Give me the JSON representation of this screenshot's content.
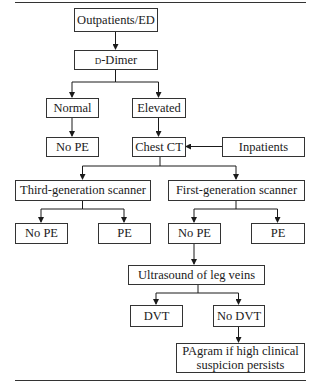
{
  "diagram": {
    "type": "flowchart",
    "nodes": {
      "outpatients": "Outpatients/ED",
      "ddimer_prefix": "d",
      "ddimer_rest": "-Dimer",
      "normal": "Normal",
      "elevated": "Elevated",
      "no_pe_1": "No PE",
      "chest_ct": "Chest CT",
      "inpatients": "Inpatients",
      "third_gen": "Third-generation scanner",
      "first_gen": "First-generation scanner",
      "third_no_pe": "No PE",
      "third_pe": "PE",
      "first_no_pe": "No PE",
      "first_pe": "PE",
      "ultrasound": "Ultrasound of leg veins",
      "dvt": "DVT",
      "no_dvt": "No DVT",
      "pagram_line1": "PAgram if high clinical",
      "pagram_line2": "suspicion persists"
    },
    "edges": [
      [
        "Outpatients/ED",
        "D-Dimer"
      ],
      [
        "D-Dimer",
        "Normal"
      ],
      [
        "D-Dimer",
        "Elevated"
      ],
      [
        "Normal",
        "No PE"
      ],
      [
        "Elevated",
        "Chest CT"
      ],
      [
        "Inpatients",
        "Chest CT"
      ],
      [
        "Chest CT",
        "Third-generation scanner"
      ],
      [
        "Chest CT",
        "First-generation scanner"
      ],
      [
        "Third-generation scanner",
        "No PE"
      ],
      [
        "Third-generation scanner",
        "PE"
      ],
      [
        "First-generation scanner",
        "No PE"
      ],
      [
        "First-generation scanner",
        "PE"
      ],
      [
        "No PE (first-generation)",
        "Ultrasound of leg veins"
      ],
      [
        "Ultrasound of leg veins",
        "DVT"
      ],
      [
        "Ultrasound of leg veins",
        "No DVT"
      ],
      [
        "No DVT",
        "PAgram if high clinical suspicion persists"
      ]
    ]
  }
}
